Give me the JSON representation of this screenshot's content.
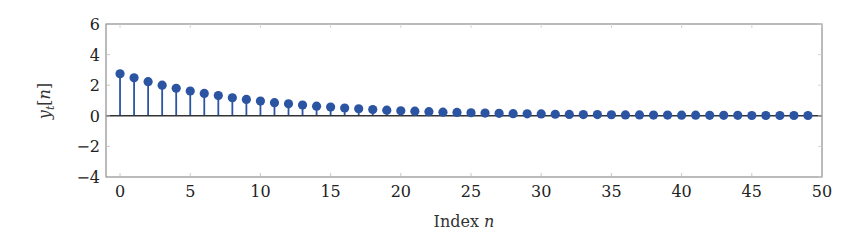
{
  "chart_data": {
    "type": "stem",
    "title": "",
    "xlabel": "Index n",
    "xlabel_main": "Index ",
    "xlabel_var": "n",
    "ylabel": "y_t[n]",
    "xlim": [
      -1,
      50
    ],
    "ylim": [
      -4,
      6
    ],
    "xticks": [
      0,
      5,
      10,
      15,
      20,
      25,
      30,
      35,
      40,
      45,
      50
    ],
    "yticks": [
      -4,
      -2,
      0,
      2,
      4,
      6
    ],
    "ytick_labels": [
      "−4",
      "−2",
      "0",
      "2",
      "4",
      "6"
    ],
    "grid": false,
    "legend": null,
    "color": "#2b55a2",
    "baseline_color": "#333333",
    "series": [
      {
        "name": "y_t[n]",
        "x": [
          0,
          1,
          2,
          3,
          4,
          5,
          6,
          7,
          8,
          9,
          10,
          11,
          12,
          13,
          14,
          15,
          16,
          17,
          18,
          19,
          20,
          21,
          22,
          23,
          24,
          25,
          26,
          27,
          28,
          29,
          30,
          31,
          32,
          33,
          34,
          35,
          36,
          37,
          38,
          39,
          40,
          41,
          42,
          43,
          44,
          45,
          46,
          47,
          48,
          49
        ],
        "values": [
          2.75,
          2.48,
          2.23,
          2.0,
          1.8,
          1.62,
          1.46,
          1.32,
          1.18,
          1.07,
          0.96,
          0.86,
          0.78,
          0.7,
          0.63,
          0.57,
          0.51,
          0.46,
          0.41,
          0.37,
          0.33,
          0.3,
          0.27,
          0.24,
          0.22,
          0.2,
          0.18,
          0.16,
          0.14,
          0.13,
          0.12,
          0.1,
          0.09,
          0.08,
          0.08,
          0.07,
          0.06,
          0.06,
          0.05,
          0.05,
          0.04,
          0.04,
          0.03,
          0.03,
          0.03,
          0.02,
          0.02,
          0.02,
          0.02,
          0.02
        ]
      }
    ]
  }
}
